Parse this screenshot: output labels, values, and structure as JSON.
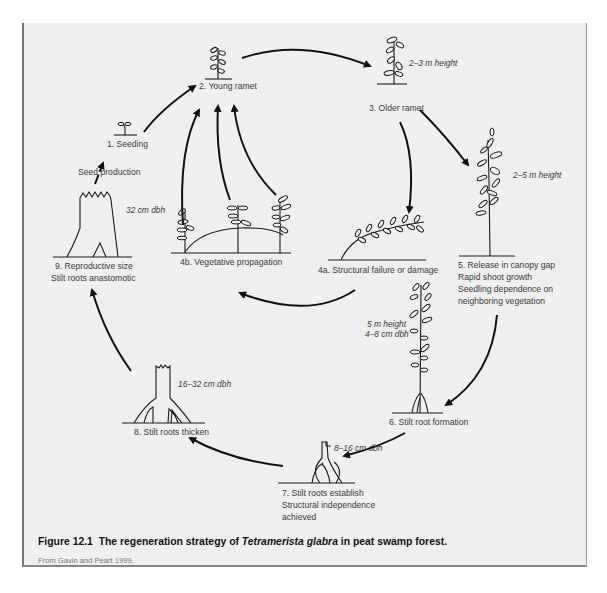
{
  "figure": {
    "number": "Figure 12.1",
    "caption_pre": "The regeneration strategy of ",
    "caption_species": "Tetramerista glabra",
    "caption_post": " in peat swamp forest.",
    "source": "From Gavin and Peart 1999."
  },
  "stages": {
    "s1": "1. Seeding",
    "s2": "2. Young ramet",
    "s3": "3. Older ramet",
    "s4a": "4a. Structural failure or damage",
    "s4b": "4b. Vegetative propagation",
    "s5_l1": "5. Release in canopy gap",
    "s5_l2": "Rapid shoot growth",
    "s5_l3": "Seedling dependence on",
    "s5_l4": "neighboring vegetation",
    "s6": "6. Stilt root formation",
    "s7_l1": "7. Stilt roots establish",
    "s7_l2": "Structural independence",
    "s7_l3": "achieved",
    "s8": "8. Stilt roots thicken",
    "s9_l1": "9. Reproductive size",
    "s9_l2": "Stilt roots anastomotic"
  },
  "annotations": {
    "seed_production": "Seed production",
    "h_2_3": "2–3 m height",
    "h_2_5": "2–5 m height",
    "h_5": "5 m height",
    "dbh_4_8": "4–8 cm dbh",
    "dbh_8_16": "8–16 cm dbh",
    "dbh_16_32": "16–32 cm dbh",
    "dbh_32": "32 cm dbh"
  }
}
